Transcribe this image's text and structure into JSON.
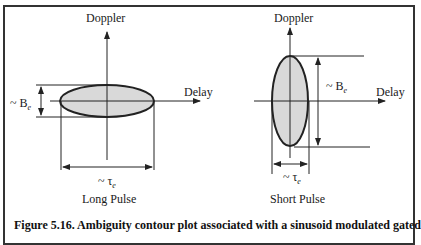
{
  "figure": {
    "caption": "Figure 5.16. Ambiguity contour plot associated with a sinusoid modulated gated",
    "colors": {
      "line": "#222222",
      "fill": "#d9d9d9",
      "border": "#333333"
    },
    "panels": [
      {
        "id": "long",
        "title": "Long Pulse",
        "y_axis_label": "Doppler",
        "x_axis_label": "Delay",
        "bandwidth_label": "~ B",
        "bandwidth_sub": "e",
        "duration_label": "~ τ",
        "duration_sub": "e",
        "shape": "wide-flat ellipse"
      },
      {
        "id": "short",
        "title": "Short Pulse",
        "y_axis_label": "Doppler",
        "x_axis_label": "Delay",
        "bandwidth_label": "~ B",
        "bandwidth_sub": "e",
        "duration_label": "~ τ",
        "duration_sub": "e",
        "shape": "tall-narrow ellipse"
      }
    ]
  }
}
